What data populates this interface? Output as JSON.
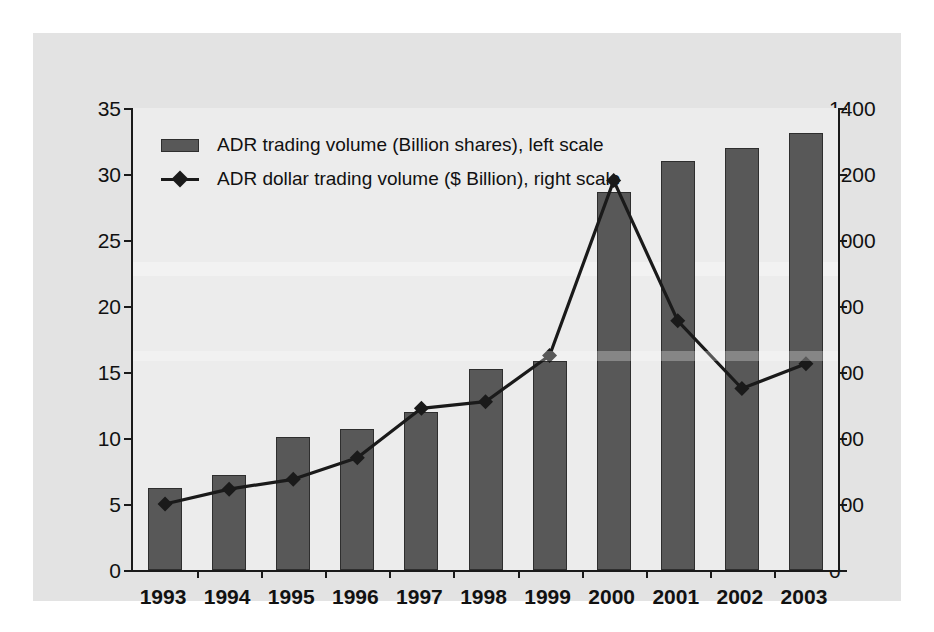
{
  "chart_data": {
    "type": "bar",
    "title": "",
    "subtitle": "",
    "xlabel": "",
    "ylabel": "",
    "grid": false,
    "legend_position": "top-left",
    "categories": [
      "1993",
      "1994",
      "1995",
      "1996",
      "1997",
      "1998",
      "1999",
      "2000",
      "2001",
      "2002",
      "2003"
    ],
    "series": [
      {
        "name": "ADR trading volume (Billion shares), left scale",
        "type": "bar",
        "axis": "left",
        "units": "Billion shares",
        "color": "#585858",
        "values": [
          6.2,
          7.2,
          10.1,
          10.7,
          12.0,
          15.2,
          15.8,
          28.6,
          31.0,
          32.0,
          33.1
        ]
      },
      {
        "name": "ADR dollar trading volume ($ Billion), right scale",
        "type": "line",
        "axis": "right",
        "units": "$ Billion",
        "color": "#1a1a1a",
        "marker": "diamond",
        "values": [
          200,
          245,
          275,
          340,
          490,
          510,
          650,
          1180,
          755,
          550,
          625
        ]
      }
    ],
    "left_axis": {
      "min": 0,
      "max": 35,
      "step": 5,
      "ticks": [
        "0",
        "5",
        "10",
        "15",
        "20",
        "25",
        "30",
        "35"
      ]
    },
    "right_axis": {
      "min": 0,
      "max": 1400,
      "step": 200,
      "ticks": [
        "0",
        "200",
        "400",
        "600",
        "800",
        "1000",
        "1200",
        "1400"
      ]
    }
  },
  "legend": {
    "items": [
      {
        "label": "ADR trading volume (Billion shares), left scale",
        "marker": "bar-swatch"
      },
      {
        "label": "ADR dollar trading volume ($ Billion), right scale",
        "marker": "line-diamond-swatch"
      }
    ]
  },
  "colors": {
    "bar_fill": "#585858",
    "line_stroke": "#1a1a1a",
    "plot_background": "#ececec",
    "panel_background": "#e3e3e3",
    "page_background": "#ffffff",
    "axis": "#1a1a1a",
    "text": "#111111"
  }
}
